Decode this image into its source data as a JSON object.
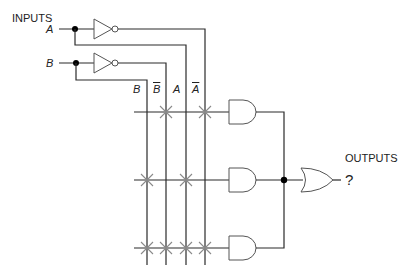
{
  "labels": {
    "inputs": "INPUTS",
    "input_a": "A",
    "input_b": "B",
    "outputs": "OUTPUTS",
    "output_value": "?"
  },
  "columns": [
    {
      "label": "B",
      "inverted": false
    },
    {
      "label": "B",
      "inverted": true
    },
    {
      "label": "A",
      "inverted": false
    },
    {
      "label": "A",
      "inverted": true
    }
  ],
  "and_gates": [
    {
      "row": 1,
      "connections": [
        "B̄",
        "Ā"
      ]
    },
    {
      "row": 2,
      "connections": [
        "B",
        "A"
      ]
    },
    {
      "row": 3,
      "connections": [
        "B",
        "B̄",
        "A",
        "Ā"
      ]
    }
  ],
  "or_gate": {
    "inputs": 3
  },
  "colors": {
    "wire": "#2b2b2b",
    "gate_outline": "#555555",
    "fuse_mark": "#8a8a8a"
  }
}
